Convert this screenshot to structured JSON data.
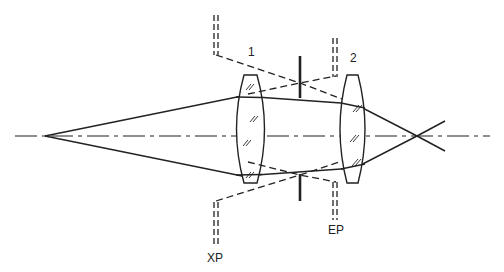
{
  "diagram": {
    "type": "optical-system",
    "colors": {
      "ink": "#222222",
      "background": "#ffffff"
    },
    "labels": {
      "lens1": "1",
      "lens2": "2",
      "exit_pupil": "XP",
      "entrance_pupil": "EP"
    },
    "elements": {
      "optical_axis": "dash-dot line",
      "object_point": "apex of ray cone",
      "lens1": "biconvex lens 1",
      "aperture_stop": "vertical stop",
      "lens2": "biconvex lens 2",
      "image_point": "ray crossing point",
      "exit_pupil_marker": "XP double-dashed marker",
      "entrance_pupil_marker": "EP double-dashed marker"
    }
  }
}
